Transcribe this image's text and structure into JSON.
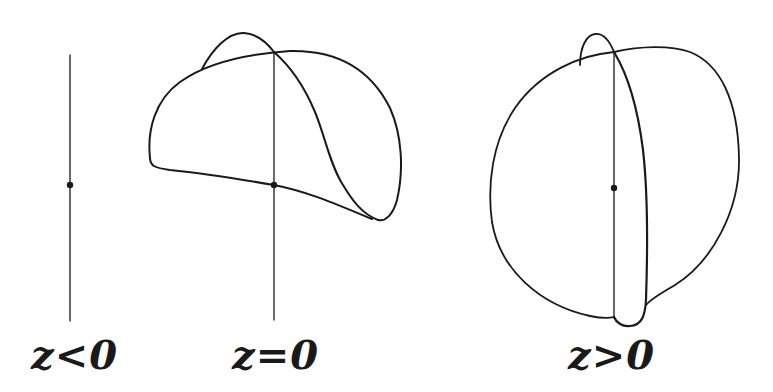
{
  "figure": {
    "type": "diagram",
    "stroke_color": "#1a1a1a",
    "background": "#ffffff",
    "panels": [
      {
        "id": "panel-z-negative",
        "label": "z<0",
        "description": "vertical axis line with a single point, no surface"
      },
      {
        "id": "panel-z-zero",
        "label": "z=0",
        "description": "vertical axis line with point; folded curved surface attached along the axis with a small lobe at top"
      },
      {
        "id": "panel-z-positive",
        "label": "z>0",
        "description": "vertical axis line with point; closed rounded surface (sphere-like) with a lens-shaped fold along the axis"
      }
    ]
  }
}
